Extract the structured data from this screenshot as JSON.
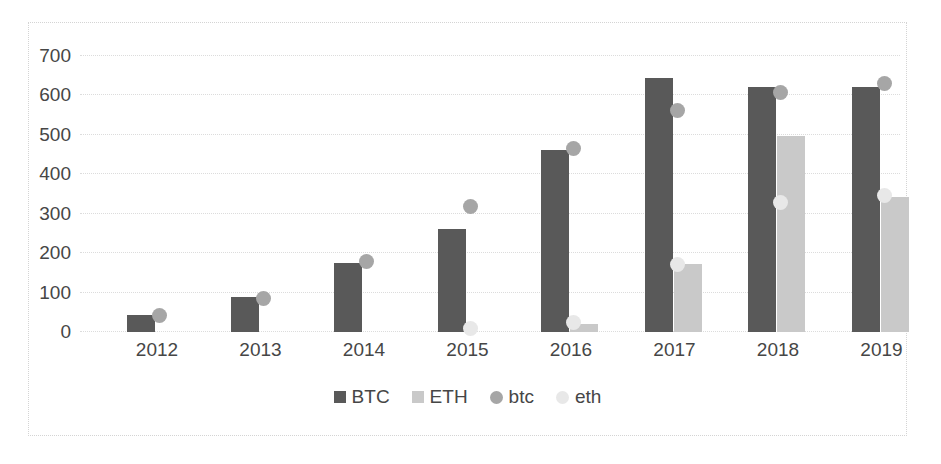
{
  "chart_data": {
    "type": "bar",
    "title": "",
    "xlabel": "",
    "ylabel": "",
    "categories": [
      "2012",
      "2013",
      "2014",
      "2015",
      "2016",
      "2017",
      "2018",
      "2019"
    ],
    "ylim": [
      0,
      700
    ],
    "yticks": [
      0,
      100,
      200,
      300,
      400,
      500,
      600,
      700
    ],
    "ytick_labels": [
      "0",
      "100",
      "200",
      "300",
      "400",
      "500",
      "600",
      "700"
    ],
    "grid": true,
    "legend_position": "bottom",
    "series": [
      {
        "name": "BTC",
        "type": "bar",
        "color": "#595959",
        "values": [
          42,
          88,
          175,
          262,
          461,
          644,
          622,
          622
        ]
      },
      {
        "name": "ETH",
        "type": "bar",
        "color": "#c9c9c9",
        "values": [
          0,
          0,
          0,
          0,
          20,
          172,
          497,
          342
        ]
      },
      {
        "name": "btc",
        "type": "scatter",
        "color": "#a6a6a6",
        "values": [
          40,
          84,
          178,
          317,
          463,
          561,
          605,
          628
        ]
      },
      {
        "name": "eth",
        "type": "scatter",
        "color": "#e8e8e8",
        "values": [
          null,
          null,
          null,
          8,
          22,
          170,
          327,
          345
        ]
      }
    ]
  },
  "legend": {
    "items": [
      {
        "label": "BTC",
        "marker": "square",
        "color": "#595959"
      },
      {
        "label": "ETH",
        "marker": "square",
        "color": "#c9c9c9"
      },
      {
        "label": "btc",
        "marker": "circle",
        "color": "#a6a6a6"
      },
      {
        "label": "eth",
        "marker": "circle",
        "color": "#e8e8e8"
      }
    ]
  }
}
